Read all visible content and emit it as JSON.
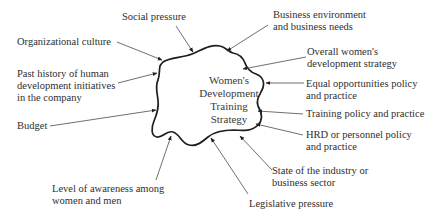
{
  "diagram": {
    "type": "influence-diagram",
    "center": {
      "lines": [
        "Women's",
        "Development",
        "Training",
        "Strategy"
      ]
    },
    "factors": [
      {
        "id": "social-pressure",
        "lines": [
          "Social pressure"
        ]
      },
      {
        "id": "business-environment",
        "lines": [
          "Business environment",
          "and business needs"
        ]
      },
      {
        "id": "organizational-culture",
        "lines": [
          "Organizational culture"
        ]
      },
      {
        "id": "overall-womens-strategy",
        "lines": [
          "Overall women's",
          "development strategy"
        ]
      },
      {
        "id": "past-history",
        "lines": [
          "Past history of human",
          "development initiatives",
          "in the company"
        ]
      },
      {
        "id": "equal-opportunities",
        "lines": [
          "Equal opportunities policy",
          "and practice"
        ]
      },
      {
        "id": "training-policy",
        "lines": [
          "Training policy and practice"
        ]
      },
      {
        "id": "budget",
        "lines": [
          "Budget"
        ]
      },
      {
        "id": "hrd-policy",
        "lines": [
          "HRD or personnel policy",
          "and practice"
        ]
      },
      {
        "id": "industry-state",
        "lines": [
          "State of the industry or",
          "business sector"
        ]
      },
      {
        "id": "awareness",
        "lines": [
          "Level of awareness among",
          "women and men"
        ]
      },
      {
        "id": "legislative-pressure",
        "lines": [
          "Legislative pressure"
        ]
      }
    ],
    "colors": {
      "outline": "#1e1e1e",
      "arrow": "#4a4a4a",
      "text": "#2e2e2e",
      "background": "#ffffff"
    }
  }
}
